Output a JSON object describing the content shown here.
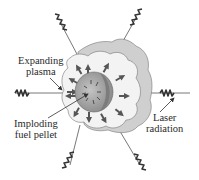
{
  "diagram": {
    "type": "laser-fusion-schematic",
    "labels": {
      "expanding_plasma": [
        "Expanding",
        "plasma"
      ],
      "imploding_pellet": [
        "Imploding",
        "fuel pellet"
      ],
      "laser_radiation": [
        "Laser",
        "radiation"
      ]
    },
    "colors": {
      "plasma_fill": "#f2f2f2",
      "plasma_shell": "#cfcfcf",
      "pellet": "#a9a9a9",
      "arrow": "#555555",
      "line": "#333333",
      "text": "#2a2a2a"
    },
    "laser_beams": 6,
    "outward_arrows": 12
  }
}
